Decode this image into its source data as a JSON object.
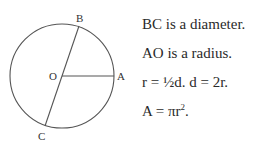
{
  "diagram": {
    "labels": {
      "B": "B",
      "O": "O",
      "A": "A",
      "C": "C"
    },
    "circle": {
      "cx": 62,
      "cy": 76,
      "r": 52
    },
    "points": {
      "B": [
        79,
        26
      ],
      "C": [
        45,
        126
      ],
      "O": [
        62,
        76
      ],
      "A": [
        114,
        76
      ]
    },
    "stroke_color": "#555555"
  },
  "notes": {
    "line1": "BC is a diameter.",
    "line2": "AO is a radius.",
    "line3": "r = ½d. d = 2r.",
    "line4_prefix": "A = πr",
    "line4_exp": "2",
    "line4_suffix": "."
  }
}
